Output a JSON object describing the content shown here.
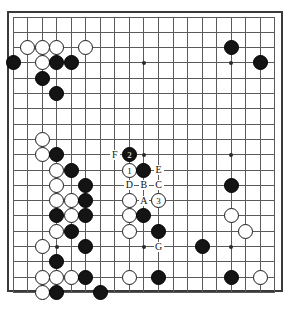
{
  "figure": {
    "kind": "go-board-diagram",
    "board_size": 19,
    "colors": {
      "black_stone": "#141414",
      "white_stone": "#ffffff",
      "line": "#5a5a5a",
      "border": "#3a3a3a",
      "background": "#ffffff"
    },
    "geometry": {
      "origin_x": 11,
      "origin_y": 15,
      "step_x": 14.55,
      "step_y": 15.3,
      "stone_diameter": 15
    },
    "hoshi": [
      {
        "col": 4,
        "row": 4
      },
      {
        "col": 10,
        "row": 4
      },
      {
        "col": 16,
        "row": 4
      },
      {
        "col": 4,
        "row": 10
      },
      {
        "col": 10,
        "row": 10
      },
      {
        "col": 16,
        "row": 10
      },
      {
        "col": 4,
        "row": 16
      },
      {
        "col": 10,
        "row": 16
      },
      {
        "col": 16,
        "row": 16
      }
    ],
    "stones": [
      {
        "col": 2,
        "row": 3,
        "color": "white",
        "label": ""
      },
      {
        "col": 3,
        "row": 3,
        "color": "white",
        "label": ""
      },
      {
        "col": 4,
        "row": 3,
        "color": "white",
        "label": ""
      },
      {
        "col": 6,
        "row": 3,
        "color": "white",
        "label": ""
      },
      {
        "col": 1,
        "row": 4,
        "color": "black",
        "label": ""
      },
      {
        "col": 3,
        "row": 4,
        "color": "white",
        "label": ""
      },
      {
        "col": 4,
        "row": 4,
        "color": "black",
        "label": ""
      },
      {
        "col": 5,
        "row": 4,
        "color": "black",
        "label": ""
      },
      {
        "col": 16,
        "row": 3,
        "color": "black",
        "label": ""
      },
      {
        "col": 18,
        "row": 4,
        "color": "black",
        "label": ""
      },
      {
        "col": 3,
        "row": 5,
        "color": "black",
        "label": ""
      },
      {
        "col": 4,
        "row": 6,
        "color": "black",
        "label": ""
      },
      {
        "col": 3,
        "row": 9,
        "color": "white",
        "label": ""
      },
      {
        "col": 3,
        "row": 10,
        "color": "white",
        "label": ""
      },
      {
        "col": 4,
        "row": 10,
        "color": "black",
        "label": ""
      },
      {
        "col": 4,
        "row": 11,
        "color": "white",
        "label": ""
      },
      {
        "col": 5,
        "row": 11,
        "color": "black",
        "label": ""
      },
      {
        "col": 4,
        "row": 12,
        "color": "white",
        "label": ""
      },
      {
        "col": 6,
        "row": 12,
        "color": "black",
        "label": ""
      },
      {
        "col": 4,
        "row": 13,
        "color": "white",
        "label": ""
      },
      {
        "col": 5,
        "row": 13,
        "color": "white",
        "label": ""
      },
      {
        "col": 6,
        "row": 13,
        "color": "black",
        "label": ""
      },
      {
        "col": 4,
        "row": 14,
        "color": "black",
        "label": ""
      },
      {
        "col": 5,
        "row": 14,
        "color": "white",
        "label": ""
      },
      {
        "col": 6,
        "row": 14,
        "color": "black",
        "label": ""
      },
      {
        "col": 4,
        "row": 15,
        "color": "white",
        "label": ""
      },
      {
        "col": 5,
        "row": 15,
        "color": "black",
        "label": ""
      },
      {
        "col": 6,
        "row": 16,
        "color": "black",
        "label": ""
      },
      {
        "col": 3,
        "row": 16,
        "color": "white",
        "label": ""
      },
      {
        "col": 4,
        "row": 17,
        "color": "black",
        "label": ""
      },
      {
        "col": 3,
        "row": 18,
        "color": "white",
        "label": ""
      },
      {
        "col": 4,
        "row": 18,
        "color": "white",
        "label": ""
      },
      {
        "col": 5,
        "row": 18,
        "color": "white",
        "label": ""
      },
      {
        "col": 6,
        "row": 18,
        "color": "black",
        "label": ""
      },
      {
        "col": 3,
        "row": 19,
        "color": "white",
        "label": ""
      },
      {
        "col": 4,
        "row": 19,
        "color": "black",
        "label": ""
      },
      {
        "col": 7,
        "row": 19,
        "color": "black",
        "label": ""
      },
      {
        "col": 9,
        "row": 10,
        "color": "black",
        "label": "2"
      },
      {
        "col": 9,
        "row": 11,
        "color": "white",
        "label": "1"
      },
      {
        "col": 10,
        "row": 11,
        "color": "black",
        "label": ""
      },
      {
        "col": 9,
        "row": 13,
        "color": "white",
        "label": ""
      },
      {
        "col": 11,
        "row": 13,
        "color": "white",
        "label": "3"
      },
      {
        "col": 9,
        "row": 14,
        "color": "white",
        "label": ""
      },
      {
        "col": 10,
        "row": 14,
        "color": "black",
        "label": ""
      },
      {
        "col": 9,
        "row": 15,
        "color": "white",
        "label": ""
      },
      {
        "col": 11,
        "row": 15,
        "color": "black",
        "label": ""
      },
      {
        "col": 9,
        "row": 18,
        "color": "white",
        "label": ""
      },
      {
        "col": 11,
        "row": 18,
        "color": "black",
        "label": ""
      },
      {
        "col": 16,
        "row": 12,
        "color": "black",
        "label": ""
      },
      {
        "col": 16,
        "row": 14,
        "color": "white",
        "label": ""
      },
      {
        "col": 17,
        "row": 15,
        "color": "white",
        "label": ""
      },
      {
        "col": 14,
        "row": 16,
        "color": "black",
        "label": ""
      },
      {
        "col": 16,
        "row": 18,
        "color": "black",
        "label": ""
      },
      {
        "col": 18,
        "row": 18,
        "color": "white",
        "label": ""
      }
    ],
    "point_markers": [
      {
        "text": "F",
        "col": 8,
        "row": 10
      },
      {
        "text": "E",
        "col": 11,
        "row": 11
      },
      {
        "text": "D",
        "col": 9,
        "row": 12
      },
      {
        "text": "B",
        "col": 10,
        "row": 12
      },
      {
        "text": "C",
        "col": 11,
        "row": 12
      },
      {
        "text": "A",
        "col": 10,
        "row": 13
      },
      {
        "text": "G",
        "col": 11,
        "row": 16
      }
    ]
  }
}
